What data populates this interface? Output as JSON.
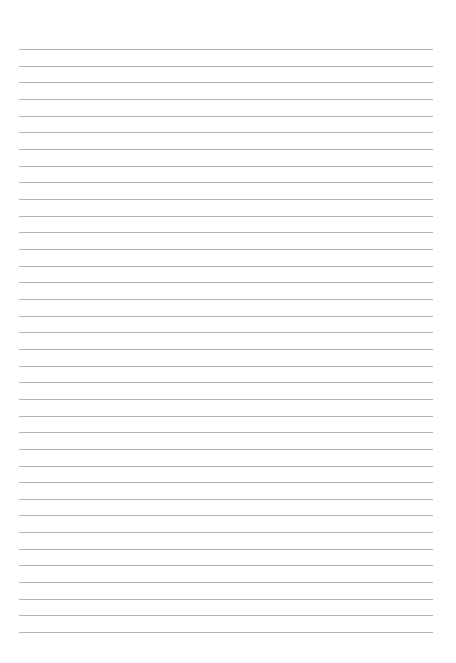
{
  "page": {
    "type": "lined-paper",
    "background": "#ffffff",
    "line_color": "#b4b4b4",
    "line_count": 36,
    "first_line_y": 49,
    "line_spacing": 16.66,
    "line_left": 19,
    "line_right": 433
  }
}
